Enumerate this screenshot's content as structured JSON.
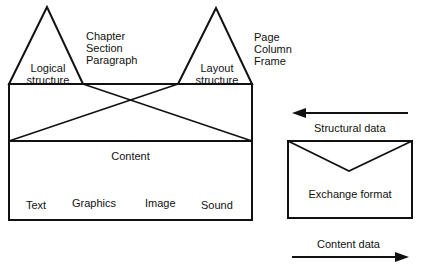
{
  "logical": {
    "label_line1": "Logical",
    "label_line2": "structure",
    "items": [
      "Chapter",
      "Section",
      "Paragraph"
    ]
  },
  "layout": {
    "label_line1": "Layout",
    "label_line2": "structure",
    "items": [
      "Page",
      "Column",
      "Frame"
    ]
  },
  "content": {
    "title": "Content",
    "types": [
      "Text",
      "Graphics",
      "Image",
      "Sound"
    ]
  },
  "exchange": {
    "structural_label": "Structural data",
    "envelope_label": "Exchange format",
    "content_label": "Content data"
  },
  "colors": {
    "stroke": "#111111",
    "background": "#ffffff"
  }
}
